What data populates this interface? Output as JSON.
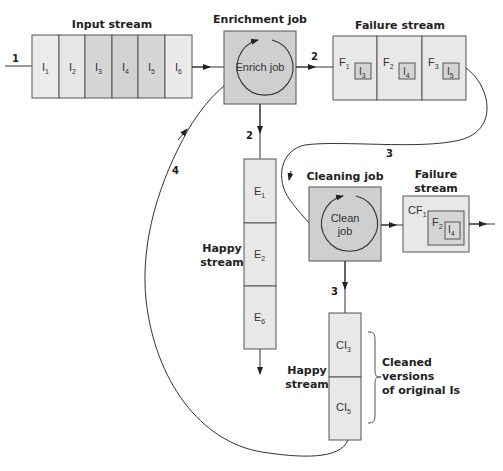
{
  "colors": {
    "cell_light": "#ececec",
    "cell_mid": "#dedede",
    "cell_dark": "#d2d2d2",
    "job_box": "#cfcfcf",
    "line": "#333333"
  },
  "steps": {
    "s1": "1",
    "s2a": "2",
    "s2b": "2",
    "s3a": "3",
    "s3b": "3",
    "s4": "4"
  },
  "input_stream": {
    "title": "Input stream",
    "cells": [
      {
        "base": "I",
        "sub": "1"
      },
      {
        "base": "I",
        "sub": "2"
      },
      {
        "base": "I",
        "sub": "3"
      },
      {
        "base": "I",
        "sub": "4"
      },
      {
        "base": "I",
        "sub": "5"
      },
      {
        "base": "I",
        "sub": "6"
      }
    ]
  },
  "enrichment_job": {
    "title": "Enrichment job",
    "label": "Enrich job"
  },
  "failure_stream": {
    "title": "Failure stream",
    "cells": [
      {
        "base": "F",
        "sub": "1",
        "inner_base": "I",
        "inner_sub": "3"
      },
      {
        "base": "F",
        "sub": "2",
        "inner_base": "I",
        "inner_sub": "4"
      },
      {
        "base": "F",
        "sub": "3",
        "inner_base": "I",
        "inner_sub": "5"
      }
    ]
  },
  "enriched_happy_stream": {
    "title_line1": "Happy",
    "title_line2": "stream",
    "cells": [
      {
        "base": "E",
        "sub": "1"
      },
      {
        "base": "E",
        "sub": "2"
      },
      {
        "base": "E",
        "sub": "6"
      }
    ]
  },
  "cleaning_job": {
    "title": "Cleaning job",
    "label_line1": "Clean",
    "label_line2": "job"
  },
  "cleaning_failure_stream": {
    "title_line1": "Failure",
    "title_line2": "stream",
    "outer": {
      "base": "CF",
      "sub": "1"
    },
    "middle": {
      "base": "F",
      "sub": "2"
    },
    "inner": {
      "base": "I",
      "sub": "4"
    }
  },
  "cleaned_happy_stream": {
    "title_line1": "Happy",
    "title_line2": "stream",
    "cells": [
      {
        "base": "CI",
        "sub": "3"
      },
      {
        "base": "CI",
        "sub": "5"
      }
    ],
    "annotation_line1": "Cleaned",
    "annotation_line2": "versions",
    "annotation_line3": "of original Is"
  }
}
